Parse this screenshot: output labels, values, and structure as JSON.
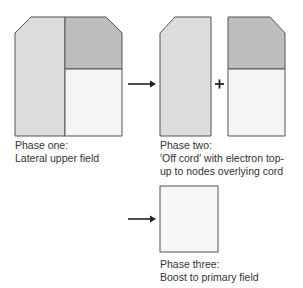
{
  "diagram": {
    "type": "radiotherapy field phases",
    "colors": {
      "lateral_field": "#dcdcdc",
      "upper_block": "#bdbdbd",
      "lower_block": "#f4f4f4",
      "primary_boost": "#f7f7f7",
      "outline": "#555555",
      "arrow": "#222222"
    },
    "phases": [
      {
        "id": "phase-one",
        "title": "Phase one:",
        "description_lines": [
          "Lateral upper field"
        ]
      },
      {
        "id": "phase-two",
        "title": "Phase two:",
        "description_lines": [
          "'Off cord' with electron top-",
          "up to nodes overlying cord"
        ]
      },
      {
        "id": "phase-three",
        "title": "Phase three:",
        "description_lines": [
          "Boost to primary field"
        ]
      }
    ],
    "connectors": {
      "arrow_1": "right-arrow",
      "plus_sign": "+",
      "arrow_2": "right-arrow"
    }
  }
}
